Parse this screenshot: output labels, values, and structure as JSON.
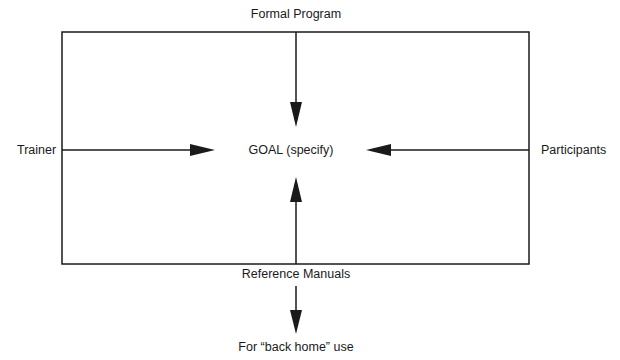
{
  "diagram": {
    "type": "flow-diagram",
    "center_node": "GOAL (specify)",
    "nodes": {
      "top": "Formal Program",
      "left": "Trainer",
      "right": "Participants",
      "bottom": "Reference Manuals",
      "below_bottom": "For “back home” use"
    },
    "edges": [
      {
        "from": "Formal Program",
        "to": "GOAL (specify)",
        "direction": "down"
      },
      {
        "from": "Trainer",
        "to": "GOAL (specify)",
        "direction": "right"
      },
      {
        "from": "Participants",
        "to": "GOAL (specify)",
        "direction": "left"
      },
      {
        "from": "Reference Manuals",
        "to": "GOAL (specify)",
        "direction": "up"
      },
      {
        "from": "Reference Manuals",
        "to": "For “back home” use",
        "direction": "down"
      }
    ],
    "colors": {
      "line": "#1a1a1a",
      "background": "#ffffff"
    }
  }
}
